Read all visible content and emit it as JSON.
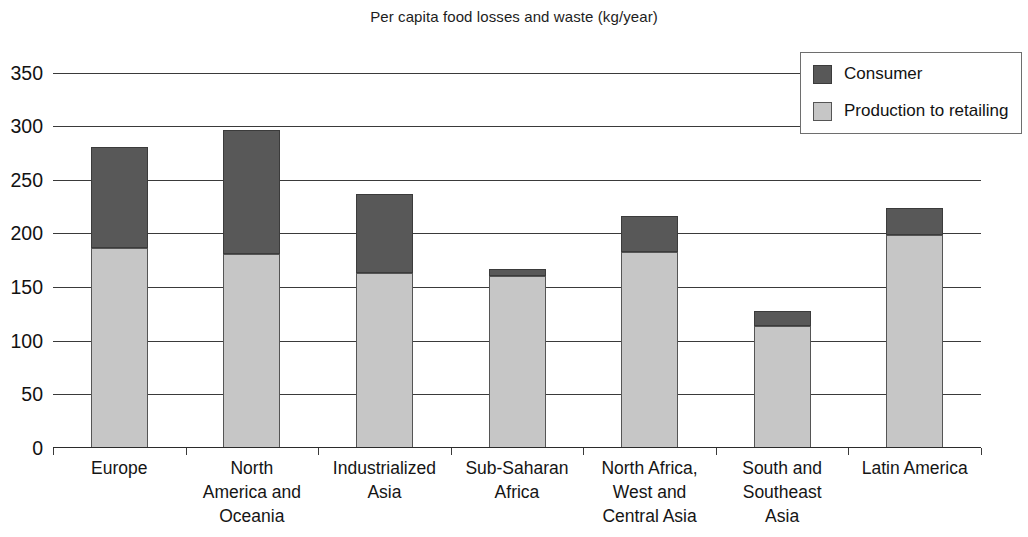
{
  "chart_data": {
    "type": "bar",
    "title": "Per capita food losses and waste (kg/year)",
    "subtitle": "",
    "xlabel": "",
    "ylabel": "",
    "stacked": true,
    "grid": true,
    "legend_position": "top-right",
    "ylim": [
      0,
      350
    ],
    "yticks": [
      0,
      50,
      100,
      150,
      200,
      250,
      300,
      350
    ],
    "ytick_labels": [
      "0",
      "50",
      "100",
      "150",
      "200",
      "250",
      "300",
      "350"
    ],
    "categories": [
      "Europe",
      "North America and Oceania",
      "Industrialized Asia",
      "Sub-Saharan Africa",
      "North Africa, West and Central Asia",
      "South and Southeast Asia",
      "Latin America"
    ],
    "category_label_lines": [
      [
        "Europe"
      ],
      [
        "North",
        "America and",
        "Oceania"
      ],
      [
        "Industrialized",
        "Asia"
      ],
      [
        "Sub-Saharan",
        "Africa"
      ],
      [
        "North Africa,",
        "West and",
        "Central Asia"
      ],
      [
        "South and",
        "Southeast",
        "Asia"
      ],
      [
        "Latin America"
      ]
    ],
    "series": [
      {
        "name": "Production to retailing",
        "color": "#c6c6c6",
        "values": [
          186,
          181,
          163,
          160,
          183,
          114,
          199
        ]
      },
      {
        "name": "Consumer",
        "color": "#585858",
        "values": [
          95,
          115,
          74,
          7,
          33,
          14,
          25
        ]
      }
    ],
    "totals": [
      281,
      296,
      237,
      167,
      216,
      128,
      224
    ]
  },
  "legend": {
    "entries": [
      {
        "label": "Consumer",
        "swatch": "consumer"
      },
      {
        "label": "Production to retailing",
        "swatch": "production"
      }
    ]
  }
}
